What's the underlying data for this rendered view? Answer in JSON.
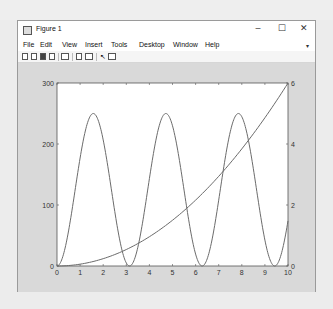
{
  "window": {
    "title": "Figure 1",
    "controls": {
      "minimize": "–",
      "maximize": "☐",
      "close": "✕"
    }
  },
  "menubar": {
    "items": [
      {
        "label": "File"
      },
      {
        "label": "Edit"
      },
      {
        "label": "View"
      },
      {
        "label": "Insert"
      },
      {
        "label": "Tools"
      },
      {
        "label": "Desktop"
      },
      {
        "label": "Window"
      },
      {
        "label": "Help"
      }
    ],
    "overflow_arrow": "▾"
  },
  "toolbar": {
    "buttons": [
      "new-figure-icon",
      "open-file-icon",
      "save-icon",
      "print-icon",
      "link-plot-icon",
      "insert-colorbar-icon",
      "insert-legend-icon",
      "pointer-icon",
      "property-inspector-icon"
    ]
  },
  "colors": {
    "plot_line": "#6b6b6b",
    "axes_bg": "#ffffff",
    "figure_bg": "#d9d9d9"
  },
  "chart_data": {
    "type": "line",
    "title": "",
    "xlabel": "",
    "ylabel_left": "",
    "ylabel_right": "",
    "xlim": [
      0,
      10
    ],
    "ylim_left": [
      0,
      300
    ],
    "ylim_right": [
      0,
      6
    ],
    "x_ticks": [
      "0",
      "1",
      "2",
      "3",
      "4",
      "5",
      "6",
      "7",
      "8",
      "9",
      "10"
    ],
    "y_ticks_left": [
      "0",
      "100",
      "200",
      "300"
    ],
    "y_ticks_right": [
      "0",
      "2",
      "4",
      "6"
    ],
    "grid": false,
    "legend": null,
    "series": [
      {
        "name": "periodic (left axis)",
        "axis": "left",
        "x": [
          0,
          0.5,
          1,
          1.5708,
          2,
          2.5,
          3.1416,
          3.5,
          4,
          4.7124,
          5,
          5.5,
          6.2832,
          6.5,
          7,
          7.854,
          8.5,
          9,
          9.4248,
          10
        ],
        "y": [
          0,
          57,
          177,
          250,
          207,
          90,
          0,
          31,
          143,
          250,
          230,
          126,
          0,
          11,
          108,
          250,
          158,
          42,
          0,
          74
        ]
      },
      {
        "name": "quadratic (right axis)",
        "axis": "right",
        "x": [
          0,
          1,
          2,
          3,
          4,
          5,
          6,
          7,
          8,
          9,
          10
        ],
        "y": [
          0,
          0.06,
          0.24,
          0.54,
          0.96,
          1.5,
          2.16,
          2.94,
          3.84,
          4.86,
          6
        ]
      }
    ]
  }
}
